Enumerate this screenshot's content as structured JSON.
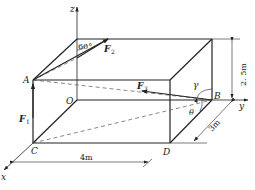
{
  "diagram": {
    "type": "3d-box-force-diagram",
    "points": {
      "A": "A",
      "B": "B",
      "C": "C",
      "D": "D",
      "O": "O"
    },
    "axes": {
      "x": "x",
      "y": "y",
      "z": "z"
    },
    "forces": {
      "F1": "F",
      "F1_sub": "1",
      "F2": "F",
      "F2_sub": "2",
      "F3": "F",
      "F3_sub": "3"
    },
    "angles": {
      "sixty": "60°",
      "gamma": "γ",
      "theta": "θ"
    },
    "dimensions": {
      "width": "4m",
      "depth": "3m",
      "height": "2. 5m"
    },
    "colors": {
      "stroke": "#222222",
      "dashed": "#555555",
      "background": "#ffffff"
    }
  }
}
